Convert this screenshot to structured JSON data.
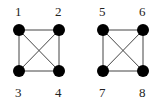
{
  "graphs": [
    {
      "name": "graph-left",
      "nodes": [
        {
          "label": "1",
          "x": 19,
          "y": 30,
          "lx": 15,
          "ly": 16
        },
        {
          "label": "2",
          "x": 59,
          "y": 30,
          "lx": 55,
          "ly": 16
        },
        {
          "label": "3",
          "x": 19,
          "y": 71,
          "lx": 15,
          "ly": 97
        },
        {
          "label": "4",
          "x": 59,
          "y": 71,
          "lx": 55,
          "ly": 97
        }
      ],
      "edges": [
        [
          "1",
          "2"
        ],
        [
          "1",
          "3"
        ],
        [
          "1",
          "4"
        ],
        [
          "2",
          "3"
        ],
        [
          "2",
          "4"
        ],
        [
          "3",
          "4"
        ]
      ]
    },
    {
      "name": "graph-right",
      "nodes": [
        {
          "label": "5",
          "x": 103,
          "y": 30,
          "lx": 99,
          "ly": 16
        },
        {
          "label": "6",
          "x": 143,
          "y": 30,
          "lx": 139,
          "ly": 16
        },
        {
          "label": "7",
          "x": 103,
          "y": 71,
          "lx": 99,
          "ly": 97
        },
        {
          "label": "8",
          "x": 143,
          "y": 71,
          "lx": 139,
          "ly": 97
        }
      ],
      "edges": [
        [
          "5",
          "6"
        ],
        [
          "5",
          "7"
        ],
        [
          "5",
          "8"
        ],
        [
          "6",
          "7"
        ],
        [
          "6",
          "8"
        ],
        [
          "7",
          "8"
        ]
      ]
    }
  ]
}
